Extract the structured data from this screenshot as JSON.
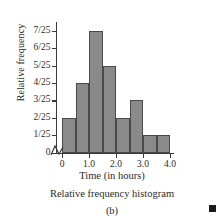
{
  "chart_data": {
    "type": "bar",
    "title": "",
    "subtitle": "",
    "caption": "Relative frequency histogram",
    "panel_label": "(b)",
    "xlabel": "Time (in hours)",
    "ylabel": "Relative frequency",
    "grid": false,
    "legend": "none",
    "axis_break_x": true,
    "xlim": [
      0,
      4.0
    ],
    "ylim": [
      0,
      0.3
    ],
    "bin_width": 0.5,
    "xticks": [
      0,
      1.0,
      2.0,
      3.0,
      4.0
    ],
    "xtick_labels": [
      "0",
      "1.0",
      "2.0",
      "3.0",
      "4.0"
    ],
    "yticks": [
      0,
      0.04,
      0.08,
      0.12,
      0.16,
      0.2,
      0.24,
      0.28
    ],
    "ytick_labels": [
      "0",
      "1/25",
      "2/25",
      "3/25",
      "4/25",
      "5/25",
      "6/25",
      "7/25"
    ],
    "bins": [
      {
        "start": 0.0,
        "end": 0.5,
        "label": "2/25",
        "value": 0.08
      },
      {
        "start": 0.5,
        "end": 1.0,
        "label": "4/25",
        "value": 0.16
      },
      {
        "start": 1.0,
        "end": 1.5,
        "label": "7/25",
        "value": 0.28
      },
      {
        "start": 1.5,
        "end": 2.0,
        "label": "5/25",
        "value": 0.2
      },
      {
        "start": 2.0,
        "end": 2.5,
        "label": "2/25",
        "value": 0.08
      },
      {
        "start": 2.5,
        "end": 3.0,
        "label": "3/25",
        "value": 0.12
      },
      {
        "start": 3.0,
        "end": 3.5,
        "label": "1/25",
        "value": 0.04
      },
      {
        "start": 3.5,
        "end": 4.0,
        "label": "1/25",
        "value": 0.04
      }
    ],
    "categories": [
      "0.0-0.5",
      "0.5-1.0",
      "1.0-1.5",
      "1.5-2.0",
      "2.0-2.5",
      "2.5-3.0",
      "3.0-3.5",
      "3.5-4.0"
    ],
    "values": [
      0.08,
      0.16,
      0.28,
      0.2,
      0.08,
      0.12,
      0.04,
      0.04
    ],
    "colors": {
      "bar_fill": "#8a8a8a",
      "bar_stroke": "#4a4a4a",
      "axis": "#3a3a3a",
      "text": "#2b2b2b",
      "marker": "#1a1a1a"
    }
  }
}
